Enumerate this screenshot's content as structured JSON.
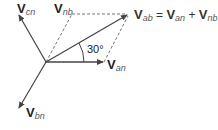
{
  "diagram": {
    "type": "phasor-diagram",
    "vectors": {
      "cn": {
        "label": "V",
        "sub": "cn"
      },
      "nb": {
        "label": "V",
        "sub": "nb"
      },
      "an": {
        "label": "V",
        "sub": "an"
      },
      "bn": {
        "label": "V",
        "sub": "bn"
      },
      "ab": {
        "label": "V",
        "sub": "ab"
      }
    },
    "equation": {
      "lhs": {
        "label": "V",
        "sub": "ab"
      },
      "eq": "=",
      "t1": {
        "label": "V",
        "sub": "an"
      },
      "plus": "+",
      "t2": {
        "label": "V",
        "sub": "nb"
      }
    },
    "angle_label": "30°",
    "colors": {
      "line": "#444444",
      "dashed": "#666666",
      "text": "#222222"
    }
  }
}
